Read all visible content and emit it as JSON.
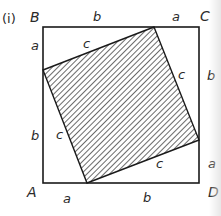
{
  "figure": {
    "panel_label": "(i)",
    "points": {
      "A": "A",
      "B": "B",
      "C": "C",
      "D": "D"
    },
    "outer_square": {
      "top_segments": [
        "b",
        "a"
      ],
      "right_segments": [
        "b",
        "a"
      ],
      "bottom_segments": [
        "a",
        "b"
      ],
      "left_segments": [
        "a",
        "b"
      ]
    },
    "inner_square": {
      "side_labels": [
        "c",
        "c",
        "c",
        "c"
      ],
      "fill": "hatched"
    },
    "colors": {
      "stroke": "#1a1a1a",
      "hatch": "#1a1a1a",
      "background": "#ffffff"
    }
  }
}
